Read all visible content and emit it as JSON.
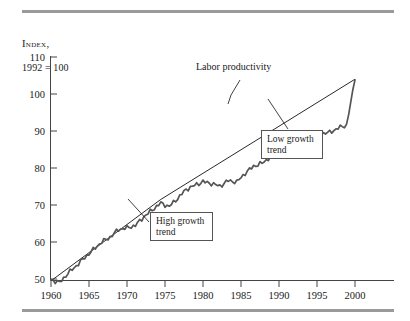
{
  "figure": {
    "axis_caption_line1": "Index,",
    "axis_caption_line2": "1992 = 100"
  },
  "annotations": {
    "labor_productivity": "Labor productivity",
    "low_growth_trend": "Low growth\ntrend",
    "low_growth_trend_line1": "Low growth",
    "low_growth_trend_line2": "trend",
    "high_growth_trend_line1": "High growth",
    "high_growth_trend_line2": "trend"
  },
  "colors": {
    "series": "#555555",
    "trend": "#111111",
    "axis": "#444444",
    "rule": "#9a9a9a"
  },
  "chart_data": {
    "type": "line",
    "title": "",
    "subtitle": "",
    "xlabel": "",
    "ylabel": "Index, 1992 = 100",
    "xlim": [
      1960,
      2000
    ],
    "ylim": [
      48,
      110
    ],
    "grid": false,
    "legend": "none",
    "xticks": [
      1960,
      1965,
      1970,
      1975,
      1980,
      1985,
      1990,
      1995,
      2000
    ],
    "yticks": [
      50,
      60,
      70,
      80,
      90,
      100,
      110
    ],
    "series": [
      {
        "name": "Labor productivity",
        "style": "thick-gray-wiggly",
        "x": [
          1960,
          1961,
          1962,
          1963,
          1964,
          1965,
          1966,
          1967,
          1968,
          1969,
          1970,
          1971,
          1972,
          1973,
          1974,
          1975,
          1976,
          1977,
          1978,
          1979,
          1980,
          1981,
          1982,
          1983,
          1984,
          1985,
          1986,
          1987,
          1988,
          1989,
          1990,
          1991,
          1992,
          1993,
          1994,
          1995,
          1996
        ],
        "values": [
          49.8,
          49.0,
          51.5,
          53.6,
          55.8,
          57.9,
          60.0,
          61.3,
          63.4,
          63.8,
          64.5,
          66.8,
          68.7,
          70.5,
          69.6,
          71.8,
          74.2,
          75.3,
          76.3,
          75.8,
          75.1,
          76.6,
          76.2,
          78.6,
          80.5,
          81.3,
          83.0,
          83.5,
          84.5,
          85.2,
          86.2,
          87.0,
          89.3,
          89.6,
          90.8,
          91.6,
          103.8
        ]
      },
      {
        "name": "High growth trend",
        "style": "thin-straight",
        "x": [
          1960,
          1973
        ],
        "values": [
          49.5,
          71.5
        ]
      },
      {
        "name": "Low growth trend",
        "style": "thin-straight",
        "x": [
          1973,
          1996
        ],
        "values": [
          71.5,
          104.0
        ]
      }
    ],
    "annotations": [
      {
        "text": "Labor productivity",
        "x": 1984,
        "y": 107,
        "points_to": {
          "x": 1981,
          "y": 93
        }
      },
      {
        "text": "Low growth trend",
        "x": 1990,
        "y": 88,
        "points_to": {
          "x": 1986,
          "y": 96
        }
      },
      {
        "text": "High growth trend",
        "x": 1970,
        "y": 66,
        "points_to": {
          "x": 1966,
          "y": 72
        }
      }
    ]
  }
}
